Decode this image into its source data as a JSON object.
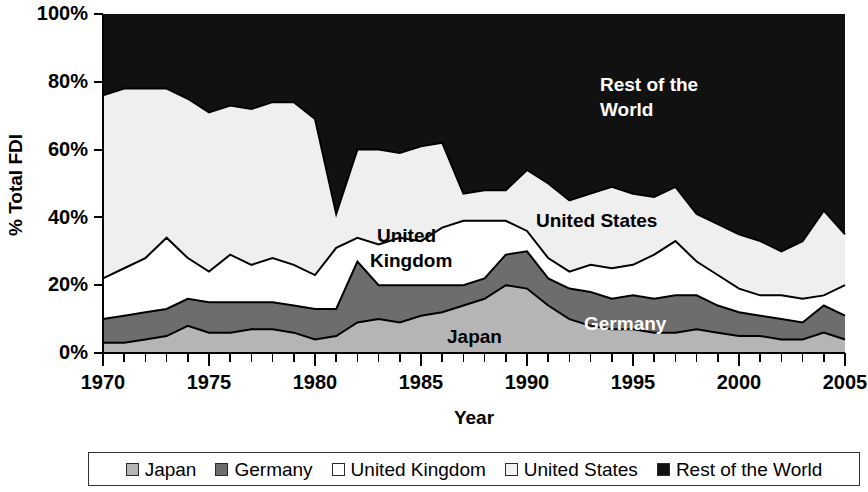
{
  "chart_data": {
    "type": "area",
    "stacked": true,
    "title": "",
    "subtitle": "",
    "xlabel": "Year",
    "ylabel": "% Total FDI",
    "xlim": [
      1970,
      2005
    ],
    "ylim": [
      0,
      100
    ],
    "grid": false,
    "legend_position": "bottom",
    "x_tick_labels": [
      "1970",
      "1975",
      "1980",
      "1985",
      "1990",
      "1995",
      "2000",
      "2005"
    ],
    "x_tick_values": [
      1970,
      1975,
      1980,
      1985,
      1990,
      1995,
      2000,
      2005
    ],
    "x_minor_tick_step": 1,
    "y_tick_labels": [
      "0%",
      "20%",
      "40%",
      "60%",
      "80%",
      "100%"
    ],
    "y_tick_values": [
      0,
      20,
      40,
      60,
      80,
      100
    ],
    "x": [
      1970,
      1971,
      1972,
      1973,
      1974,
      1975,
      1976,
      1977,
      1978,
      1979,
      1980,
      1981,
      1982,
      1983,
      1984,
      1985,
      1986,
      1987,
      1988,
      1989,
      1990,
      1991,
      1992,
      1993,
      1994,
      1995,
      1996,
      1997,
      1998,
      1999,
      2000,
      2001,
      2002,
      2003,
      2004,
      2005
    ],
    "series": [
      {
        "name": "Japan",
        "color": "#b5b5b5",
        "values": [
          3,
          3,
          4,
          5,
          8,
          6,
          6,
          7,
          7,
          6,
          4,
          5,
          9,
          10,
          9,
          11,
          12,
          14,
          16,
          20,
          19,
          14,
          10,
          8,
          7,
          7,
          6,
          6,
          7,
          6,
          5,
          5,
          4,
          4,
          6,
          4
        ]
      },
      {
        "name": "Germany",
        "color": "#6d6d6d",
        "values": [
          7,
          8,
          8,
          8,
          8,
          9,
          9,
          8,
          8,
          8,
          9,
          8,
          18,
          10,
          11,
          9,
          8,
          6,
          6,
          9,
          11,
          8,
          9,
          10,
          9,
          10,
          10,
          11,
          10,
          8,
          7,
          6,
          6,
          5,
          8,
          7
        ]
      },
      {
        "name": "United Kingdom",
        "color": "#ffffff",
        "values": [
          12,
          14,
          16,
          21,
          12,
          9,
          14,
          11,
          13,
          12,
          10,
          18,
          7,
          12,
          14,
          13,
          17,
          19,
          17,
          10,
          6,
          6,
          5,
          8,
          9,
          9,
          13,
          16,
          10,
          9,
          7,
          6,
          7,
          7,
          3,
          9
        ]
      },
      {
        "name": "United States",
        "color": "#efefef",
        "values": [
          54,
          53,
          50,
          44,
          47,
          47,
          44,
          46,
          46,
          48,
          46,
          10,
          26,
          28,
          25,
          28,
          25,
          8,
          9,
          9,
          18,
          22,
          21,
          21,
          24,
          21,
          17,
          16,
          14,
          15,
          16,
          16,
          13,
          17,
          25,
          15
        ]
      },
      {
        "name": "Rest of the World",
        "color": "#111111",
        "values": [
          24,
          22,
          22,
          22,
          25,
          29,
          27,
          28,
          26,
          26,
          31,
          59,
          40,
          40,
          41,
          39,
          38,
          53,
          52,
          52,
          46,
          50,
          55,
          53,
          51,
          53,
          54,
          51,
          59,
          62,
          65,
          67,
          70,
          67,
          58,
          65
        ]
      }
    ],
    "cumulative_top": {
      "japan": [
        3,
        3,
        4,
        5,
        8,
        6,
        6,
        7,
        7,
        6,
        4,
        5,
        9,
        10,
        9,
        11,
        12,
        14,
        16,
        20,
        19,
        14,
        10,
        8,
        7,
        7,
        6,
        6,
        7,
        6,
        5,
        5,
        4,
        4,
        6,
        4
      ],
      "germany": [
        10,
        11,
        12,
        13,
        16,
        15,
        15,
        15,
        15,
        14,
        13,
        13,
        27,
        20,
        20,
        20,
        20,
        20,
        22,
        29,
        30,
        22,
        19,
        18,
        16,
        17,
        16,
        17,
        17,
        14,
        12,
        11,
        10,
        9,
        14,
        11
      ],
      "united_kingdom": [
        22,
        25,
        28,
        34,
        28,
        24,
        29,
        26,
        28,
        26,
        23,
        31,
        34,
        32,
        34,
        33,
        37,
        39,
        39,
        39,
        36,
        28,
        24,
        26,
        25,
        26,
        29,
        33,
        27,
        23,
        19,
        17,
        17,
        16,
        17,
        20
      ],
      "united_states": [
        76,
        78,
        78,
        78,
        75,
        71,
        73,
        72,
        74,
        74,
        69,
        41,
        60,
        60,
        59,
        61,
        62,
        47,
        48,
        48,
        54,
        50,
        45,
        47,
        49,
        47,
        46,
        49,
        41,
        38,
        35,
        33,
        30,
        33,
        42,
        35
      ]
    },
    "series_labels_in_plot": [
      {
        "text": "Rest of the",
        "series": "Rest of the World",
        "style": "light"
      },
      {
        "text": "World",
        "series": "Rest of the World",
        "style": "light"
      },
      {
        "text": "United States",
        "series": "United States",
        "style": "dark"
      },
      {
        "text": "United",
        "series": "United Kingdom",
        "style": "dark"
      },
      {
        "text": "Kingdom",
        "series": "United Kingdom",
        "style": "dark"
      },
      {
        "text": "Germany",
        "series": "Germany",
        "style": "light"
      },
      {
        "text": "Japan",
        "series": "Japan",
        "style": "dark"
      }
    ]
  },
  "axes": {
    "y_title": "% Total FDI",
    "x_title": "Year",
    "y_ticks": [
      "100%",
      "80%",
      "60%",
      "40%",
      "20%",
      "0%"
    ],
    "x_ticks": [
      "1970",
      "1975",
      "1980",
      "1985",
      "1990",
      "1995",
      "2000",
      "2005"
    ]
  },
  "plot_labels": {
    "rest_of_world_line1": "Rest of the",
    "rest_of_world_line2": "World",
    "united_states": "United States",
    "united_kingdom_line1": "United",
    "united_kingdom_line2": "Kingdom",
    "germany": "Germany",
    "japan": "Japan"
  },
  "legend": {
    "items": [
      {
        "label": "Japan",
        "color": "#b5b5b5"
      },
      {
        "label": "Germany",
        "color": "#6d6d6d"
      },
      {
        "label": "United Kingdom",
        "color": "#ffffff"
      },
      {
        "label": "United States",
        "color": "#f2f2f2"
      },
      {
        "label": "Rest of the World",
        "color": "#111111"
      }
    ]
  }
}
